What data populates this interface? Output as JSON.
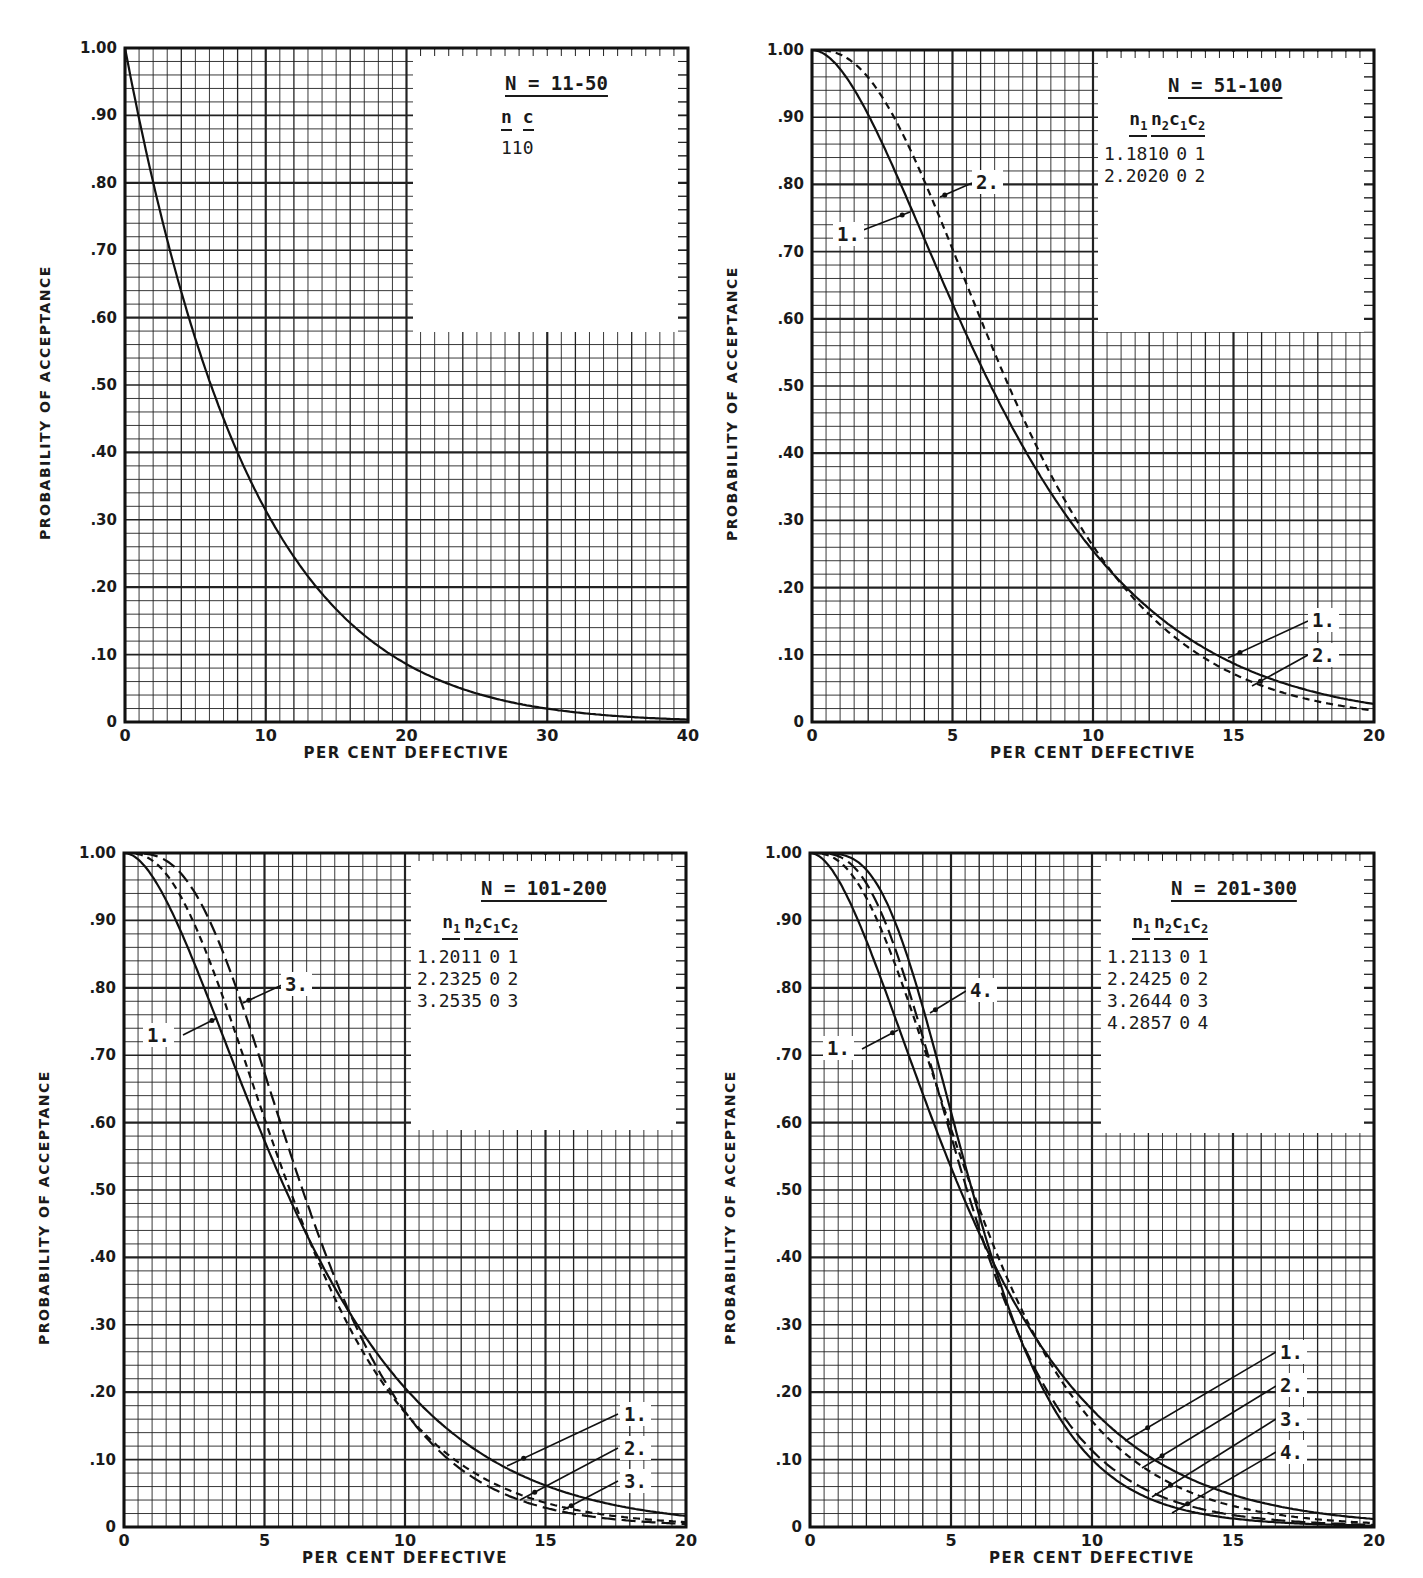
{
  "page": {
    "top_cutoff_text": "…ing sampling plans… (partially cropped header line)"
  },
  "axes_common": {
    "ylabel": "PROBABILITY OF ACCEPTANCE",
    "xlabel": "PER CENT DEFECTIVE",
    "yticks": [
      "0",
      ".10",
      ".20",
      ".30",
      ".40",
      ".50",
      ".60",
      ".70",
      ".80",
      ".90",
      "1.00"
    ]
  },
  "chart_data": [
    {
      "id": "tl",
      "type": "line",
      "title": "N = 11-50",
      "xlabel": "PER CENT DEFECTIVE",
      "ylabel": "PROBABILITY OF ACCEPTANCE",
      "xlim": [
        0,
        40
      ],
      "ylim": [
        0,
        1.0
      ],
      "xticks": [
        "0",
        "10",
        "20",
        "30",
        "40"
      ],
      "xtick_values": [
        0,
        10,
        20,
        30,
        40
      ],
      "grid": true,
      "grid_minor_x": 40,
      "grid_minor_y": 50,
      "grid_major_x": 4,
      "grid_major_y": 5,
      "plan_type": "single",
      "legend": {
        "headers": [
          "n",
          "c"
        ],
        "rows": [
          {
            "label": "",
            "n": 11,
            "c": 0
          }
        ]
      },
      "series": [
        {
          "name": "n=11, c=0",
          "style": "solid",
          "n": 11,
          "c": 0,
          "x": [
            0,
            2,
            4,
            6,
            8,
            10,
            15,
            20,
            25,
            30,
            35,
            40
          ],
          "values": [
            1.0,
            0.8,
            0.64,
            0.51,
            0.4,
            0.31,
            0.17,
            0.09,
            0.04,
            0.02,
            0.01,
            0.004
          ]
        }
      ],
      "curve_labels": [],
      "box": {
        "left": 125,
        "top": 48,
        "width": 563,
        "height": 674
      },
      "legend_box": {
        "left": 413,
        "top": 48,
        "width": 275,
        "height": 282
      }
    },
    {
      "id": "tr",
      "type": "line",
      "title": "N = 51-100",
      "xlabel": "PER CENT DEFECTIVE",
      "ylabel": "PROBABILITY OF ACCEPTANCE",
      "xlim": [
        0,
        20
      ],
      "ylim": [
        0,
        1.0
      ],
      "xticks": [
        "0",
        "5",
        "10",
        "15",
        "20"
      ],
      "xtick_values": [
        0,
        5,
        10,
        15,
        20
      ],
      "grid": true,
      "grid_minor_x": 40,
      "grid_minor_y": 50,
      "grid_major_x": 4,
      "grid_major_y": 5,
      "plan_type": "double",
      "legend": {
        "headers": [
          "n1",
          "n2",
          "c1",
          "c2"
        ],
        "rows": [
          {
            "label": "1.",
            "n1": 18,
            "n2": 10,
            "c1": 0,
            "c2": 1
          },
          {
            "label": "2.",
            "n1": 20,
            "n2": 20,
            "c1": 0,
            "c2": 2
          }
        ]
      },
      "series": [
        {
          "name": "1.",
          "style": "solid",
          "n1": 18,
          "n2": 10,
          "c1": 0,
          "c2": 1,
          "x": [
            0,
            2,
            4,
            5,
            6,
            8,
            10,
            12,
            15,
            20
          ],
          "values": [
            1.0,
            0.93,
            0.74,
            0.63,
            0.53,
            0.37,
            0.26,
            0.18,
            0.1,
            0.03
          ]
        },
        {
          "name": "2.",
          "style": "dashed",
          "n1": 20,
          "n2": 20,
          "c1": 0,
          "c2": 2,
          "x": [
            0,
            2,
            4,
            5,
            6,
            8,
            10,
            12,
            15,
            20
          ],
          "values": [
            1.0,
            0.96,
            0.8,
            0.68,
            0.57,
            0.39,
            0.26,
            0.17,
            0.09,
            0.02
          ]
        }
      ],
      "curve_labels": [
        {
          "text": "1.",
          "left": 833,
          "top": 222,
          "ax": 858,
          "ay": 232,
          "tx": 910,
          "ty": 212
        },
        {
          "text": "2.",
          "left": 972,
          "top": 170,
          "ax": 972,
          "ay": 183,
          "tx": 940,
          "ty": 197
        },
        {
          "text": "1.",
          "left": 1308,
          "top": 608,
          "ax": 1308,
          "ay": 621,
          "tx": 1228,
          "ty": 658
        },
        {
          "text": "2.",
          "left": 1308,
          "top": 643,
          "ax": 1308,
          "ay": 655,
          "tx": 1252,
          "ty": 686
        }
      ],
      "box": {
        "left": 812,
        "top": 50,
        "width": 562,
        "height": 672
      },
      "legend_box": {
        "left": 1098,
        "top": 50,
        "width": 276,
        "height": 280
      }
    },
    {
      "id": "bl",
      "type": "line",
      "title": "N = 101-200",
      "xlabel": "PER CENT DEFECTIVE",
      "ylabel": "PROBABILITY OF ACCEPTANCE",
      "xlim": [
        0,
        20
      ],
      "ylim": [
        0,
        1.0
      ],
      "xticks": [
        "0",
        "5",
        "10",
        "15",
        "20"
      ],
      "xtick_values": [
        0,
        5,
        10,
        15,
        20
      ],
      "grid": true,
      "grid_minor_x": 40,
      "grid_minor_y": 50,
      "grid_major_x": 4,
      "grid_major_y": 5,
      "plan_type": "double",
      "legend": {
        "headers": [
          "n1",
          "n2",
          "c1",
          "c2"
        ],
        "rows": [
          {
            "label": "1.",
            "n1": 20,
            "n2": 11,
            "c1": 0,
            "c2": 1
          },
          {
            "label": "2.",
            "n1": 23,
            "n2": 25,
            "c1": 0,
            "c2": 2
          },
          {
            "label": "3.",
            "n1": 25,
            "n2": 35,
            "c1": 0,
            "c2": 3
          }
        ]
      },
      "series": [
        {
          "name": "1.",
          "style": "solid",
          "n1": 20,
          "n2": 11,
          "c1": 0,
          "c2": 1,
          "x": [
            0,
            2,
            4,
            5,
            6,
            8,
            10,
            12,
            15,
            20
          ],
          "values": [
            1.0,
            0.92,
            0.7,
            0.58,
            0.47,
            0.3,
            0.2,
            0.13,
            0.06,
            0.02
          ]
        },
        {
          "name": "2.",
          "style": "dashed",
          "n1": 23,
          "n2": 25,
          "c1": 0,
          "c2": 2,
          "x": [
            0,
            2,
            4,
            5,
            6,
            8,
            10,
            12,
            15,
            20
          ],
          "values": [
            1.0,
            0.96,
            0.75,
            0.61,
            0.48,
            0.27,
            0.15,
            0.08,
            0.03,
            0.01
          ]
        },
        {
          "name": "3.",
          "style": "longdash",
          "n1": 25,
          "n2": 35,
          "c1": 0,
          "c2": 3,
          "x": [
            0,
            2,
            4,
            5,
            6,
            8,
            10,
            12,
            15,
            20
          ],
          "values": [
            1.0,
            0.98,
            0.8,
            0.64,
            0.49,
            0.26,
            0.13,
            0.06,
            0.02,
            0.005
          ]
        }
      ],
      "curve_labels": [
        {
          "text": "3.",
          "left": 281,
          "top": 972,
          "ax": 282,
          "ay": 985,
          "tx": 243,
          "ty": 1003
        },
        {
          "text": "1.",
          "left": 143,
          "top": 1023,
          "ax": 183,
          "ay": 1035,
          "tx": 217,
          "ty": 1018
        },
        {
          "text": "1.",
          "left": 620,
          "top": 1402,
          "ax": 618,
          "ay": 1414,
          "tx": 507,
          "ty": 1466
        },
        {
          "text": "2.",
          "left": 620,
          "top": 1436,
          "ax": 618,
          "ay": 1448,
          "tx": 520,
          "ty": 1500
        },
        {
          "text": "3.",
          "left": 620,
          "top": 1469,
          "ax": 618,
          "ay": 1481,
          "tx": 563,
          "ty": 1510
        }
      ],
      "box": {
        "left": 124,
        "top": 853,
        "width": 562,
        "height": 674
      },
      "legend_box": {
        "left": 411,
        "top": 853,
        "width": 275,
        "height": 275
      }
    },
    {
      "id": "br",
      "type": "line",
      "title": "N = 201-300",
      "xlabel": "PER CENT DEFECTIVE",
      "ylabel": "PROBABILITY OF ACCEPTANCE",
      "xlim": [
        0,
        20
      ],
      "ylim": [
        0,
        1.0
      ],
      "xticks": [
        "0",
        "5",
        "10",
        "15",
        "20"
      ],
      "xtick_values": [
        0,
        5,
        10,
        15,
        20
      ],
      "grid": true,
      "grid_minor_x": 40,
      "grid_minor_y": 50,
      "grid_major_x": 4,
      "grid_major_y": 5,
      "plan_type": "double",
      "legend": {
        "headers": [
          "n1",
          "n2",
          "c1",
          "c2"
        ],
        "rows": [
          {
            "label": "1.",
            "n1": 21,
            "n2": 13,
            "c1": 0,
            "c2": 1
          },
          {
            "label": "2.",
            "n1": 24,
            "n2": 25,
            "c1": 0,
            "c2": 2
          },
          {
            "label": "3.",
            "n1": 26,
            "n2": 44,
            "c1": 0,
            "c2": 3
          },
          {
            "label": "4.",
            "n1": 28,
            "n2": 57,
            "c1": 0,
            "c2": 4
          }
        ]
      },
      "series": [
        {
          "name": "1.",
          "style": "solid",
          "n1": 21,
          "n2": 13,
          "c1": 0,
          "c2": 1,
          "x": [
            0,
            2,
            4,
            5,
            6,
            8,
            10,
            12,
            15,
            20
          ],
          "values": [
            1.0,
            0.91,
            0.68,
            0.55,
            0.44,
            0.27,
            0.17,
            0.1,
            0.05,
            0.01
          ]
        },
        {
          "name": "2.",
          "style": "dashed",
          "n1": 24,
          "n2": 25,
          "c1": 0,
          "c2": 2,
          "x": [
            0,
            2,
            4,
            5,
            6,
            8,
            10,
            12,
            15,
            20
          ],
          "values": [
            1.0,
            0.95,
            0.73,
            0.59,
            0.45,
            0.24,
            0.12,
            0.06,
            0.02,
            0.004
          ]
        },
        {
          "name": "3.",
          "style": "longdash",
          "n1": 26,
          "n2": 44,
          "c1": 0,
          "c2": 3,
          "x": [
            0,
            2,
            4,
            5,
            6,
            8,
            10,
            12,
            15,
            20
          ],
          "values": [
            1.0,
            0.98,
            0.77,
            0.59,
            0.43,
            0.2,
            0.09,
            0.04,
            0.01,
            0.001
          ]
        },
        {
          "name": "4.",
          "style": "solid",
          "n1": 28,
          "n2": 57,
          "c1": 0,
          "c2": 4,
          "x": [
            0,
            2,
            4,
            5,
            6,
            8,
            10,
            12,
            15,
            20
          ],
          "values": [
            1.0,
            0.99,
            0.8,
            0.6,
            0.42,
            0.18,
            0.07,
            0.03,
            0.005,
            0.0005
          ]
        }
      ],
      "curve_labels": [
        {
          "text": "4.",
          "left": 966,
          "top": 978,
          "ax": 966,
          "ay": 991,
          "tx": 930,
          "ty": 1013
        },
        {
          "text": "1.",
          "left": 823,
          "top": 1036,
          "ax": 862,
          "ay": 1049,
          "tx": 898,
          "ty": 1030
        },
        {
          "text": "1.",
          "left": 1276,
          "top": 1340,
          "ax": 1276,
          "ay": 1352,
          "tx": 1125,
          "ty": 1441
        },
        {
          "text": "2.",
          "left": 1276,
          "top": 1373,
          "ax": 1276,
          "ay": 1386,
          "tx": 1142,
          "ty": 1468
        },
        {
          "text": "3.",
          "left": 1276,
          "top": 1407,
          "ax": 1276,
          "ay": 1419,
          "tx": 1152,
          "ty": 1497
        },
        {
          "text": "4.",
          "left": 1276,
          "top": 1440,
          "ax": 1276,
          "ay": 1452,
          "tx": 1172,
          "ty": 1513
        }
      ],
      "box": {
        "left": 810,
        "top": 853,
        "width": 564,
        "height": 674
      },
      "legend_box": {
        "left": 1101,
        "top": 853,
        "width": 273,
        "height": 278
      }
    }
  ]
}
